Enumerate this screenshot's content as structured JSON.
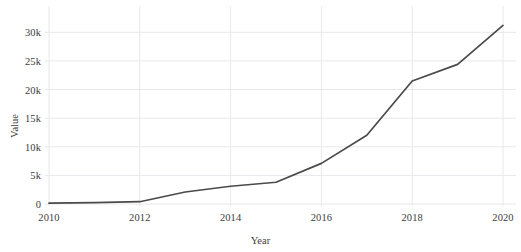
{
  "chart_data": {
    "type": "line",
    "title": "",
    "subtitle": "",
    "xlabel": "Year",
    "ylabel": "Value",
    "x": [
      2010,
      2011,
      2012,
      2013,
      2014,
      2015,
      2016,
      2017,
      2018,
      2019,
      2020
    ],
    "series": [
      {
        "name": "Value",
        "color": "#4a4a4a",
        "values": [
          150,
          250,
          400,
          2100,
          3100,
          3800,
          7100,
          12000,
          21500,
          24400,
          31200
        ]
      }
    ],
    "xlim": [
      2010,
      2020
    ],
    "ylim": [
      0,
      32500
    ],
    "xticks": [
      2010,
      2012,
      2014,
      2016,
      2018,
      2020
    ],
    "xtick_labels": [
      "2010",
      "2012",
      "2014",
      "2016",
      "2018",
      "2020"
    ],
    "yticks": [
      0,
      5000,
      10000,
      15000,
      20000,
      25000,
      30000
    ],
    "ytick_labels": [
      "0",
      "5k",
      "10k",
      "15k",
      "20k",
      "25k",
      "30k"
    ],
    "grid": true,
    "grid_color": "#e8e8ec",
    "legend": false,
    "legend_position": "none",
    "background_color": "#ffffff",
    "annotations": []
  }
}
